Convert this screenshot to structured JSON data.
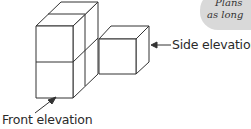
{
  "diagram": {
    "type": "isometric-cube-solid",
    "labels": {
      "side": "Side elevation",
      "front": "Front elevation"
    },
    "note": {
      "line1": "Plans",
      "line2": "as long"
    },
    "colors": {
      "stroke": "#333333",
      "fill": "#ffffff",
      "note_bg": "#d9d9d9",
      "text": "#2a2a2a"
    }
  }
}
